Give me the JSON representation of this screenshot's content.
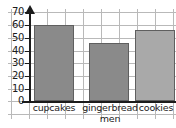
{
  "chart_data": {
    "type": "bar",
    "title": "",
    "xlabel": "",
    "ylabel": "",
    "categories": [
      "cupcakes",
      "gingerbread men",
      "cookies"
    ],
    "values": [
      60,
      46,
      56
    ],
    "ylim": [
      0,
      70
    ],
    "y_ticks": [
      0,
      10,
      20,
      30,
      40,
      50,
      60,
      70
    ],
    "grid": true,
    "legend": "none",
    "bar_colors": [
      "#8a8a8a",
      "#8a8a8a",
      "#a9a9a9"
    ],
    "bar_border_color": "#5f5f5f",
    "axis_color": "#1b1b1b",
    "grid_color": "#b9b9b9"
  },
  "axis": {
    "y_tick_labels": [
      "0",
      "10",
      "20",
      "30",
      "40",
      "50",
      "60",
      "70"
    ],
    "x_tick_labels": [
      {
        "line1": "cupcakes",
        "line2": ""
      },
      {
        "line1": "gingerbread",
        "line2": "men"
      },
      {
        "line1": "cookies",
        "line2": ""
      }
    ]
  }
}
